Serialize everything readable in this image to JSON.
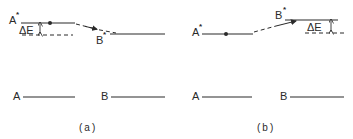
{
  "colors": {
    "ink": "#2a2a2a",
    "background": "#ffffff"
  },
  "panel_a": {
    "caption": "(a)",
    "excited_left_label": "A",
    "excited_left_star": "*",
    "excited_right_label": "B",
    "excited_right_star": "*",
    "delta_label": "ΔE",
    "ground_left_label": "A",
    "ground_right_label": "B"
  },
  "panel_b": {
    "caption": "(b)",
    "excited_left_label": "A",
    "excited_left_star": "*",
    "excited_right_label": "B",
    "excited_right_star": "*",
    "delta_label": "ΔE",
    "ground_left_label": "A",
    "ground_right_label": "B"
  }
}
